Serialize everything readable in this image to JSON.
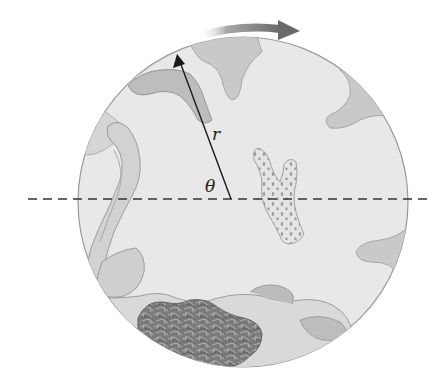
{
  "figure": {
    "labels": {
      "radius": "r",
      "angle": "θ"
    },
    "rotation_direction": "clockwise",
    "colors": {
      "background": "#ffffff",
      "drum_fill": "#e9e9e9",
      "drum_outline": "#9a9a9a",
      "baffle_fill": "#c8c8c8",
      "rotation_arrow": "#777777",
      "radius_line": "#1a1a1a",
      "dashed_axis": "#333333",
      "cloth_light": "#d8d8d8",
      "cloth_mid": "#b8b8b8",
      "cloth_dark": "#6f6f6f"
    }
  }
}
